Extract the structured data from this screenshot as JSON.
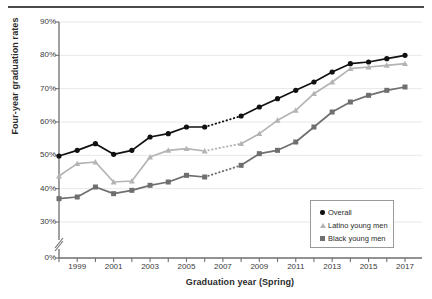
{
  "chart_data": {
    "type": "line",
    "title": "",
    "xlabel": "Graduation year (Spring)",
    "ylabel": "Four-year graduation rates",
    "grid": true,
    "legend_position": "bottom-right",
    "x": [
      1998,
      1999,
      2000,
      2001,
      2002,
      2003,
      2004,
      2005,
      2006,
      2007,
      2008,
      2009,
      2010,
      2011,
      2012,
      2013,
      2014,
      2015,
      2016,
      2017
    ],
    "xtick_labels": [
      "1999",
      "2001",
      "2003",
      "2005",
      "2007",
      "2009",
      "2011",
      "2013",
      "2015",
      "2017"
    ],
    "xticks": [
      1999,
      2001,
      2003,
      2005,
      2007,
      2009,
      2011,
      2013,
      2015,
      2017
    ],
    "xlim": [
      1998,
      2017
    ],
    "ytick_labels": [
      "0%",
      "30%",
      "40%",
      "50%",
      "60%",
      "70%",
      "80%",
      "90%"
    ],
    "yticks": [
      0,
      30,
      40,
      50,
      60,
      70,
      80,
      90
    ],
    "ylim": [
      30,
      90
    ],
    "axis_break": true,
    "axis_break_note": "y-axis broken between 0% and 30%",
    "missing_year": 2007,
    "series": [
      {
        "name": "Overall",
        "marker": "circle",
        "color": "#111111",
        "values": [
          49.8,
          51.5,
          53.5,
          50.3,
          51.5,
          55.5,
          56.5,
          58.5,
          58.5,
          null,
          61.8,
          64.5,
          67.0,
          69.5,
          72.0,
          75.0,
          77.5,
          78.0,
          79.0,
          80.0
        ]
      },
      {
        "name": "Latino young men",
        "marker": "triangle",
        "color": "#b4b4b4",
        "values": [
          43.8,
          47.5,
          48.0,
          42.0,
          42.3,
          49.5,
          51.5,
          52.0,
          51.3,
          null,
          53.5,
          56.5,
          60.5,
          63.5,
          68.5,
          72.0,
          76.0,
          76.5,
          77.0,
          77.5
        ]
      },
      {
        "name": "Black young men",
        "marker": "square",
        "color": "#6f6f6f",
        "values": [
          37.0,
          37.5,
          40.5,
          38.5,
          39.5,
          41.0,
          42.0,
          44.0,
          43.5,
          null,
          47.0,
          50.5,
          51.5,
          54.0,
          58.5,
          63.0,
          66.0,
          68.0,
          69.5,
          70.5
        ]
      }
    ]
  },
  "legend": {
    "items": [
      {
        "label": "Overall",
        "marker": "circle"
      },
      {
        "label": "Latino young men",
        "marker": "triangle"
      },
      {
        "label": "Black young men",
        "marker": "square"
      }
    ]
  }
}
